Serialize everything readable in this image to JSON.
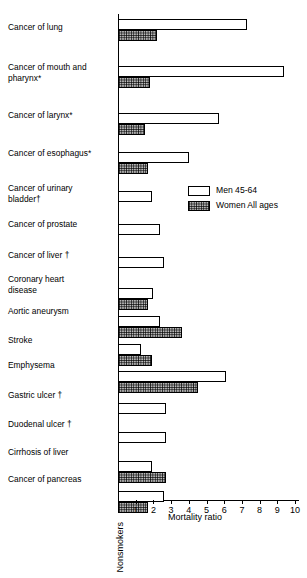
{
  "chart_data": {
    "type": "bar",
    "orientation": "horizontal",
    "title": "",
    "xlabel": "Mortality ratio",
    "ylabel": "",
    "xlim": [
      0,
      10.2
    ],
    "grid": false,
    "baseline_label": "Nonsmokers",
    "baseline_value": 1,
    "xticks": [
      1,
      2,
      3,
      4,
      5,
      6,
      7,
      8,
      9,
      10
    ],
    "xtick_labels": [
      "1",
      "2",
      "3",
      "4",
      "5",
      "6",
      "7",
      "8",
      "9",
      "10"
    ],
    "legend": {
      "position": "inside-right",
      "entries": [
        {
          "name": "Men  45-64",
          "swatch": "open-white"
        },
        {
          "name": "Women  All ages",
          "swatch": "hatched-grey"
        }
      ]
    },
    "categories": [
      "Cancer of lung",
      "Cancer of mouth and pharynx*",
      "Cancer of larynx*",
      "Cancer of esophagus*",
      "Cancer of urinary bladder†",
      "Cancer of prostate",
      "Cancer of liver †",
      "Coronary heart disease",
      "Aortic aneurysm",
      "Stroke",
      "Emphysema",
      "Gastric ulcer †",
      "Duodenal ulcer †",
      "Cirrhosis of liver",
      "Cancer of pancreas"
    ],
    "series": [
      {
        "name": "Men  45-64",
        "values": [
          7.3,
          9.4,
          5.7,
          4.0,
          1.9,
          2.4,
          2.6,
          2.0,
          2.4,
          1.3,
          6.1,
          2.7,
          2.7,
          1.9,
          2.6
        ]
      },
      {
        "name": "Women  All ages",
        "values": [
          2.2,
          1.8,
          1.5,
          1.7,
          null,
          null,
          null,
          1.7,
          3.6,
          1.9,
          4.5,
          null,
          null,
          2.7,
          1.7
        ]
      }
    ],
    "footnote_markers": [
      "*",
      "†"
    ]
  },
  "labels": {
    "rows": [
      {
        "line1": "Cancer of lung",
        "line2": ""
      },
      {
        "line1": "Cancer of mouth and",
        "line2": "pharynx*"
      },
      {
        "line1": "Cancer of larynx*",
        "line2": ""
      },
      {
        "line1": "Cancer of esophagus*",
        "line2": ""
      },
      {
        "line1": "Cancer of urinary",
        "line2": "bladder†"
      },
      {
        "line1": "Cancer of prostate",
        "line2": ""
      },
      {
        "line1": "Cancer of liver †",
        "line2": ""
      },
      {
        "line1": "Coronary heart",
        "line2": "disease"
      },
      {
        "line1": "Aortic aneurysm",
        "line2": ""
      },
      {
        "line1": "Stroke",
        "line2": ""
      },
      {
        "line1": "Emphysema",
        "line2": ""
      },
      {
        "line1": "Gastric ulcer †",
        "line2": ""
      },
      {
        "line1": "Duodenal ulcer †",
        "line2": ""
      },
      {
        "line1": "Cirrhosis of liver",
        "line2": ""
      },
      {
        "line1": "Cancer of pancreas",
        "line2": ""
      }
    ]
  },
  "colors": {
    "axis": "#000000",
    "men_fill": "#ffffff",
    "women_fill": "#b9b9b9",
    "outline": "#000000",
    "background": "#ffffff"
  }
}
